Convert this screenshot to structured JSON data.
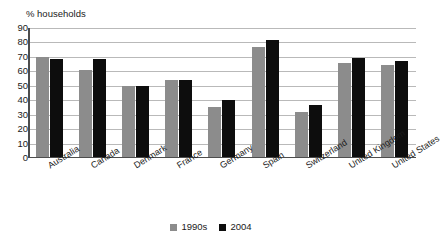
{
  "chart_data": {
    "type": "bar",
    "title": "% households",
    "xlabel": "",
    "ylabel": "% households",
    "ylim": [
      0,
      90
    ],
    "ytick_step": 10,
    "yticks": [
      90,
      80,
      70,
      60,
      50,
      40,
      30,
      20,
      10,
      0
    ],
    "grid": true,
    "legend_position": "bottom",
    "categories": [
      "Australia",
      "Canada",
      "Denmark",
      "France",
      "Germany",
      "Spain",
      "Switzerland",
      "United Kingdom",
      "United States"
    ],
    "series": [
      {
        "name": "1990s",
        "color": "#8c8c8c",
        "values": [
          70,
          61,
          50,
          54,
          35,
          77,
          32,
          66,
          64.5
        ]
      },
      {
        "name": "2004",
        "color": "#0d0d0d",
        "values": [
          68.5,
          68.5,
          50,
          54,
          40,
          82,
          36.5,
          69.5,
          67.5
        ]
      }
    ]
  },
  "legend": {
    "entries": [
      {
        "label": "1990s",
        "color": "#8c8c8c"
      },
      {
        "label": "2004",
        "color": "#0d0d0d"
      }
    ]
  },
  "colors": {
    "series_1990s": "#8c8c8c",
    "series_2004": "#0d0d0d",
    "gridline": "#b9b9b9",
    "axis": "#4d4d4d",
    "background": "#ffffff",
    "text": "#1a1a1a"
  }
}
